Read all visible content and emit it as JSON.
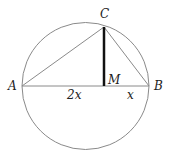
{
  "diagram": {
    "points": {
      "A": "A",
      "B": "B",
      "C": "C",
      "M": "M"
    },
    "segment_labels": {
      "AM": "2x",
      "MB": "x"
    },
    "colors": {
      "stroke": "#888888",
      "highlight": "#111111",
      "text": "#222222"
    }
  }
}
